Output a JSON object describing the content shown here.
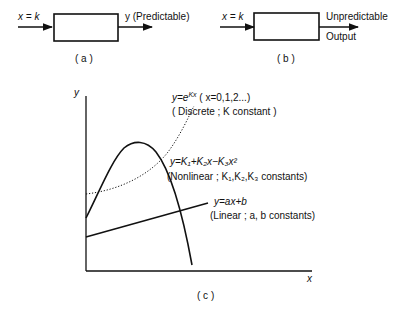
{
  "panel_a": {
    "input_label": "x = k",
    "output_label": "y  (Predictable)",
    "caption": "( a )"
  },
  "panel_b": {
    "input_label": "x = k",
    "output_label_line1": "Unpredictable",
    "output_label_line2": "Output",
    "caption": "( b )"
  },
  "panel_c": {
    "y_axis_label": "y",
    "x_axis_label": "x",
    "caption": "( c )",
    "curves": {
      "exponential": {
        "equation": "y=e^Kx  (x=0,1,2...)",
        "eq_main": "y=e",
        "eq_sup": "Kx",
        "eq_rest": "  ( x=0,1,2...)",
        "note": "( Discrete ;  K constant )",
        "style": "dotted"
      },
      "quadratic": {
        "equation": "y=K1+K2x−K3x^2",
        "eq_text": "y=K₁+K₂x−K₃x²",
        "note": "(Nonlinear ; K₁,K₂,K₃  constants)",
        "style": "solid"
      },
      "linear": {
        "equation": "y=ax+b",
        "note": "(Linear ; a, b constants)",
        "style": "solid"
      }
    }
  }
}
